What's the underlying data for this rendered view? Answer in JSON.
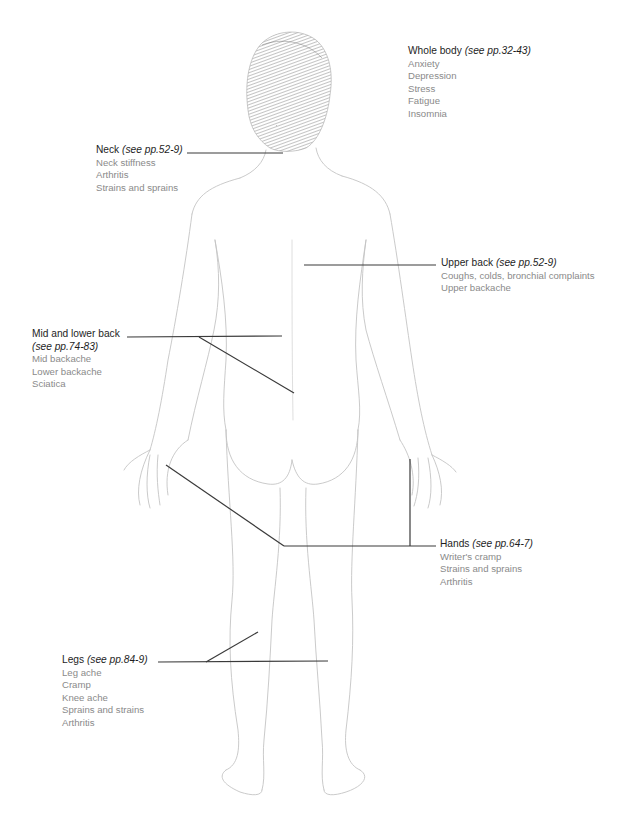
{
  "diagram": {
    "leader_color": "#3a3a3a",
    "sketch_color": "#c8c8c8",
    "hair_color": "#7a7a7a",
    "title_color": "#1e1e1e",
    "item_color": "#8a8a8a"
  },
  "regions": {
    "whole_body": {
      "title": "Whole body",
      "ref": "(see pp.32-43)",
      "items": [
        "Anxiety",
        "Depression",
        "Stress",
        "Fatigue",
        "Insomnia"
      ]
    },
    "neck": {
      "title": "Neck",
      "ref": "(see pp.52-9)",
      "items": [
        "Neck stiffness",
        "Arthritis",
        "Strains and sprains"
      ]
    },
    "upper_back": {
      "title": "Upper back",
      "ref": "(see pp.52-9)",
      "items": [
        "Coughs, colds, bronchial complaints",
        "Upper backache"
      ]
    },
    "mid_lower_back": {
      "title": "Mid and lower back",
      "ref": "(see pp.74-83)",
      "items": [
        "Mid backache",
        "Lower backache",
        "Sciatica"
      ]
    },
    "hands": {
      "title": "Hands",
      "ref": "(see pp.64-7)",
      "items": [
        "Writer's cramp",
        "Strains and sprains",
        "Arthritis"
      ]
    },
    "legs": {
      "title": "Legs",
      "ref": "(see pp.84-9)",
      "items": [
        "Leg ache",
        "Cramp",
        "Knee ache",
        "Sprains and strains",
        "Arthritis"
      ]
    }
  }
}
